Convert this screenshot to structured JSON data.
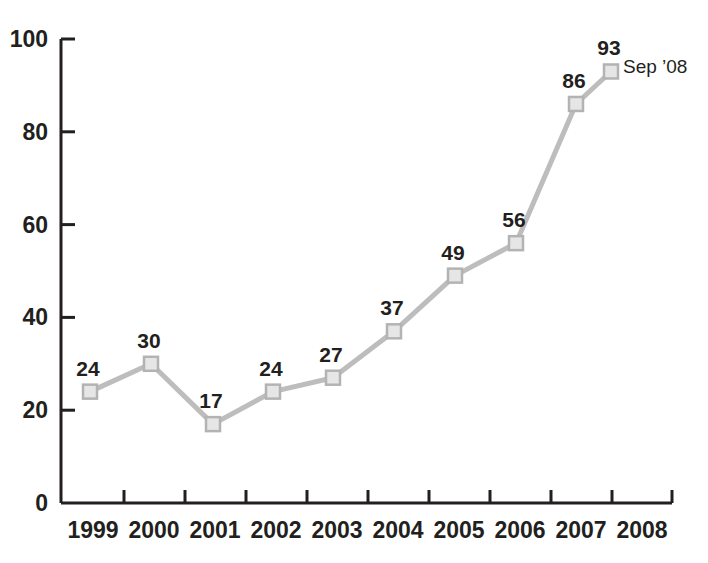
{
  "chart_data": {
    "type": "line",
    "title": "",
    "subtitle": "",
    "xlabel": "",
    "ylabel": "",
    "categories": [
      "1999",
      "2000",
      "2001",
      "2002",
      "2003",
      "2004",
      "2005",
      "2006",
      "2007",
      "2008"
    ],
    "x": [
      1999,
      2000,
      2001,
      2002,
      2003,
      2004,
      2005,
      2006,
      2007,
      2008
    ],
    "values": [
      24,
      30,
      17,
      24,
      27,
      37,
      49,
      56,
      86,
      93
    ],
    "point_labels": [
      "24",
      "30",
      "17",
      "24",
      "27",
      "37",
      "49",
      "56",
      "86",
      "93"
    ],
    "ylim": [
      0,
      100
    ],
    "ytick_labels": [
      "0",
      "20",
      "40",
      "60",
      "80",
      "100"
    ],
    "ytick_values": [
      0,
      20,
      40,
      60,
      80,
      100
    ],
    "xtick_labels": [
      "1999",
      "2000",
      "2001",
      "2002",
      "2003",
      "2004",
      "2005",
      "2006",
      "2007",
      "2008"
    ],
    "grid": false,
    "legend": null,
    "annotations": [
      {
        "name": "last-point-annotation",
        "text": "Sep ’08",
        "attached_to_value": 93,
        "attached_to_category": "2008"
      }
    ],
    "series": [
      {
        "name": "series-1",
        "values": [
          24,
          30,
          17,
          24,
          27,
          37,
          49,
          56,
          86,
          93
        ]
      }
    ],
    "colors": {
      "line": "#bdbdbd",
      "marker_fill": "#e6e6e6",
      "marker_stroke": "#b3b3b3",
      "axis": "#231f20",
      "text": "#231f20",
      "background": "#ffffff"
    }
  },
  "geometry": {
    "plot_left": 61,
    "plot_right": 672,
    "baseline_y": 503,
    "top_y": 39,
    "marker_x": [
      90,
      151,
      213,
      273,
      333,
      394,
      455,
      516,
      576,
      611
    ],
    "ytick_y": [
      503,
      413,
      320,
      227,
      133,
      39
    ],
    "xtick_x": [
      124,
      185,
      246,
      307,
      368,
      429,
      490,
      551,
      612,
      672
    ],
    "xlabel_center_x": [
      93,
      154,
      215,
      276,
      337,
      398,
      459,
      520,
      581,
      642
    ],
    "annotation_x": 623,
    "annotation_y": 73
  }
}
